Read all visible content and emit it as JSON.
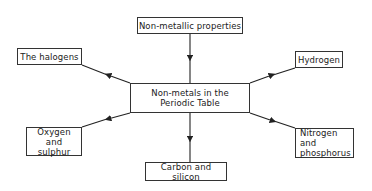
{
  "diagram": {
    "center": {
      "label": "Non-metals in the Periodic Table"
    },
    "nodes": [
      {
        "id": "top",
        "label": "Non-metallic properties",
        "direction": "into-center"
      },
      {
        "id": "halogens",
        "label": "The halogens",
        "direction": "out-of-center"
      },
      {
        "id": "hydrogen",
        "label": "Hydrogen",
        "direction": "out-of-center"
      },
      {
        "id": "oxygen",
        "label": "Oxygen and sulphur",
        "direction": "out-of-center"
      },
      {
        "id": "nitrogen",
        "label": "Nitrogen and phosphorus",
        "direction": "out-of-center"
      },
      {
        "id": "carbon",
        "label": "Carbon and silicon",
        "direction": "out-of-center"
      }
    ]
  }
}
